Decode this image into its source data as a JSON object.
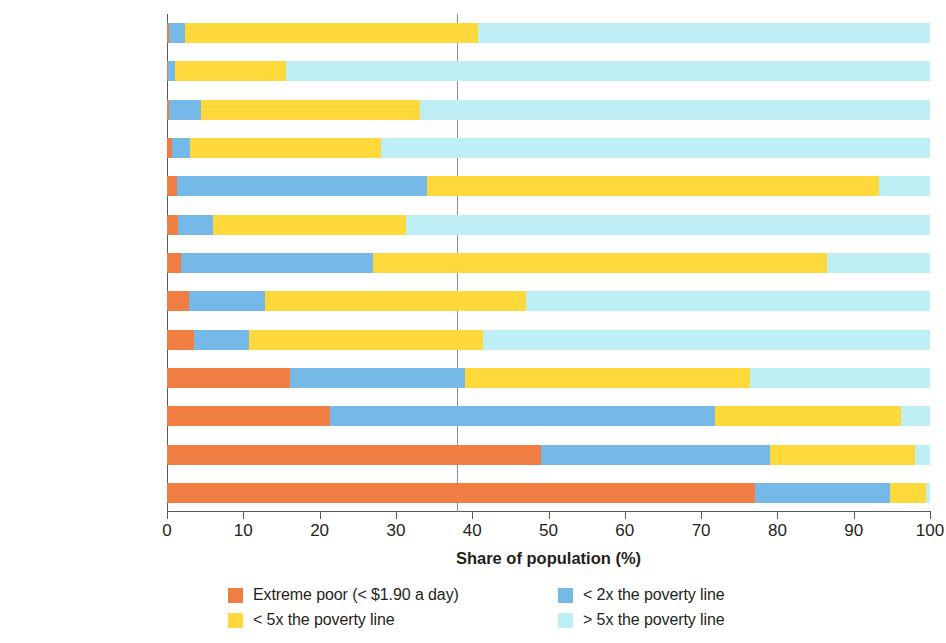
{
  "chart_data": {
    "type": "bar",
    "orientation": "horizontal",
    "stacked": true,
    "title": "",
    "xlabel": "Share of population (%)",
    "ylabel": "",
    "xlim": [
      0,
      100
    ],
    "xticks": [
      0,
      10,
      20,
      30,
      40,
      50,
      60,
      70,
      80,
      90,
      100
    ],
    "xtick_labels": [
      "0",
      "10",
      "20",
      "30",
      "40",
      "50",
      "60",
      "70",
      "80",
      "90",
      "100"
    ],
    "grid": false,
    "reference_line": 38,
    "legend_position": "bottom",
    "categories": [
      "Thailand",
      "Russian Federation",
      "Turkey",
      "Chile",
      "Kyrgyz Republic",
      "Costa Rica",
      "Armenia",
      "Peru",
      "Brazil",
      "Honduras",
      "India",
      "Togo",
      "Congo, Dem. Rep."
    ],
    "series": [
      {
        "name": "Extreme poor (< $1.90 a day)",
        "color": "#F07E42",
        "values": [
          0.2,
          0.1,
          0.3,
          0.7,
          1.3,
          1.5,
          1.8,
          2.9,
          3.6,
          16.1,
          21.4,
          49.0,
          77.1
        ]
      },
      {
        "name": "< 2x the poverty line",
        "color": "#74B9E8",
        "values": [
          2.2,
          1.0,
          4.2,
          2.3,
          32.8,
          4.5,
          25.2,
          9.9,
          7.2,
          22.9,
          50.4,
          30.0,
          17.7
        ]
      },
      {
        "name": "< 5x the poverty line",
        "color": "#FFD93B",
        "values": [
          38.3,
          14.5,
          28.7,
          25.0,
          59.2,
          25.3,
          59.5,
          34.3,
          30.6,
          37.4,
          24.4,
          19.0,
          4.7
        ]
      },
      {
        "name": "> 5x the poverty line",
        "color": "#BDEFF4",
        "values": [
          59.3,
          84.4,
          66.8,
          72.0,
          6.7,
          68.7,
          13.5,
          52.9,
          58.6,
          23.6,
          3.8,
          2.0,
          0.5
        ]
      }
    ]
  },
  "legend": {
    "items": [
      {
        "label": "Extreme poor (< $1.90 a day)",
        "color": "#F07E42"
      },
      {
        "label": "< 2x the poverty line",
        "color": "#74B9E8"
      },
      {
        "label": "< 5x the poverty line",
        "color": "#FFD93B"
      },
      {
        "label": "> 5x the poverty line",
        "color": "#BDEFF4"
      }
    ]
  },
  "axis": {
    "x_title": "Share of population (%)"
  }
}
